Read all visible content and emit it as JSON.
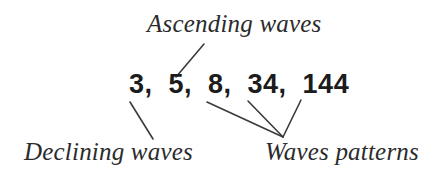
{
  "figure": {
    "background_color": "#ffffff",
    "line_color": "#3a3a3a",
    "text_color": "#2b2b2b",
    "sequence_color": "#1c1c1c"
  },
  "sequence": {
    "text": "3,  5,  8,  34,  144",
    "values": [
      3,
      5,
      8,
      34,
      144
    ]
  },
  "labels": {
    "ascending": "Ascending waves",
    "declining": "Declining waves",
    "waves_patterns": "Waves patterns"
  },
  "connectors": [
    {
      "name": "ascending-to-eight",
      "from_label": "Ascending waves",
      "to_value": "8",
      "x1": 204,
      "y1": 44,
      "x2": 176,
      "y2": 77
    },
    {
      "name": "three-to-declining",
      "from_value": "3",
      "to_label": "Declining waves",
      "x1": 130,
      "y1": 102,
      "x2": 153,
      "y2": 139
    },
    {
      "name": "eight-to-waves-patterns",
      "from_value": "8",
      "to_label": "Waves patterns",
      "x1": 207,
      "y1": 102,
      "x2": 283,
      "y2": 137
    },
    {
      "name": "thirtyfour-to-waves-patterns",
      "from_value": "34",
      "to_label": "Waves patterns",
      "x1": 248,
      "y1": 101,
      "x2": 283,
      "y2": 137
    },
    {
      "name": "onefourfour-to-waves-patterns",
      "from_value": "144",
      "to_label": "Waves patterns",
      "x1": 301,
      "y1": 100,
      "x2": 283,
      "y2": 137
    }
  ]
}
